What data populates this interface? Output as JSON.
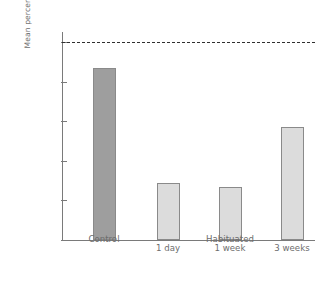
{
  "chart_data": {
    "type": "bar",
    "title": "",
    "xlabel": "",
    "ylabel": "Mean percent of connections",
    "categories": [
      "Control",
      "1 day",
      "1 week",
      "3 weeks"
    ],
    "values": [
      87,
      29,
      27,
      57
    ],
    "ylim": [
      0,
      105
    ],
    "yticks": [
      0,
      20,
      40,
      60,
      80,
      100
    ],
    "ytick_labels": [
      "0",
      "20",
      "40",
      "60",
      "80",
      "100"
    ],
    "grid": false,
    "legend": "none",
    "bar_colors": [
      "#9e9e9e",
      "#dcdcdc",
      "#dcdcdc",
      "#dcdcdc"
    ],
    "bar_edge_color": "#8a8a8a",
    "axis_color": "#7a7a7a",
    "text_color": "#6d6d6d",
    "annotations": [
      {
        "name": "reference-line",
        "kind": "hline",
        "value": 100,
        "style": "dashed",
        "color": "#2f2f2f"
      }
    ],
    "xtick_labels": [
      "",
      "1 day",
      "1 week",
      "3 weeks"
    ],
    "group_labels": [
      {
        "label": "Control",
        "covers": [
          "Control"
        ]
      },
      {
        "label": "Habituated",
        "covers": [
          "1 day",
          "1 week",
          "3 weeks"
        ]
      }
    ]
  }
}
